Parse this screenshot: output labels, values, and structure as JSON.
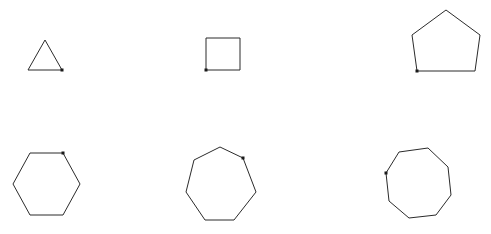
{
  "figure": {
    "background_color": "#ffffff",
    "stroke_color": "#2b2b2b",
    "marker_color": "#1a1a1a",
    "stroke_width": 1,
    "marker_size": 3,
    "width": 491,
    "height": 234,
    "layout": {
      "rows": 2,
      "columns": 3,
      "description": "Six regular polygons arranged in a 2 by 3 grid, each with a small filled square marker at its first vertex."
    }
  },
  "chart_data": {
    "type": "diagram",
    "xlabel": "",
    "ylabel": "",
    "grid": false,
    "legend": false,
    "shapes": [
      {
        "name": "triangle",
        "label": "triangle",
        "sides": 3,
        "row": 1,
        "column": 1,
        "center": [
          45,
          60
        ],
        "radius": 20,
        "start_angle_deg": -30,
        "bbox": [
          28,
          40,
          62,
          70
        ],
        "marker_vertex": [
          62,
          70
        ],
        "marker_position": "bottom-right",
        "points": "62,70 28,70 45,40"
      },
      {
        "name": "square",
        "label": "square",
        "sides": 4,
        "row": 1,
        "column": 2,
        "center": [
          223,
          54
        ],
        "radius": 24,
        "start_angle_deg": 135,
        "bbox": [
          206,
          38,
          240,
          70
        ],
        "marker_vertex": [
          206,
          70
        ],
        "marker_position": "bottom-left",
        "points": "206,70 206,38 240,38 240,70"
      },
      {
        "name": "pentagon",
        "label": "pentagon",
        "sides": 5,
        "row": 1,
        "column": 3,
        "center": [
          446,
          45
        ],
        "radius": 36,
        "start_angle_deg": 216,
        "bbox": [
          412,
          10,
          480,
          75
        ],
        "marker_vertex": [
          417,
          71
        ],
        "marker_position": "bottom-left",
        "points": "417,71 412,35 446,10 480,35 475,71"
      },
      {
        "name": "hexagon",
        "label": "hexagon",
        "sides": 6,
        "row": 2,
        "column": 1,
        "center": [
          46,
          184
        ],
        "radius": 34,
        "start_angle_deg": -60,
        "bbox": [
          13,
          152,
          80,
          216
        ],
        "marker_vertex": [
          63,
          153
        ],
        "marker_position": "top-right",
        "points": "63,153 80,184 63,215 30,215 13,184 30,153"
      },
      {
        "name": "heptagon",
        "label": "heptagon",
        "sides": 7,
        "row": 2,
        "column": 2,
        "center": [
          220,
          184
        ],
        "radius": 37,
        "start_angle_deg": -51,
        "bbox": [
          185,
          147,
          256,
          221
        ],
        "marker_vertex": [
          243,
          158
        ],
        "marker_position": "top-right",
        "points": "243,158 256,192 234,220 205,220 186,192 194,160 220,147"
      },
      {
        "name": "octagon",
        "label": "octagon",
        "sides": 8,
        "row": 2,
        "column": 3,
        "center": [
          418,
          183
        ],
        "radius": 34,
        "start_angle_deg": 157,
        "bbox": [
          386,
          148,
          451,
          218
        ],
        "marker_vertex": [
          386,
          173
        ],
        "marker_position": "left",
        "points": "386,173 399,152 428,148 448,167 451,195 436,215 409,218 389,201"
      }
    ]
  }
}
